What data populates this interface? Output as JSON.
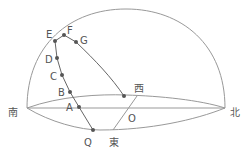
{
  "diagram": {
    "title": "",
    "colors": {
      "line": "#999999",
      "path": "#555555",
      "point": "#555555",
      "text": "#555555"
    },
    "directions": {
      "south": "南",
      "north": "北",
      "east": "東",
      "west": "西"
    },
    "center_label": "O",
    "points": [
      {
        "label": "A"
      },
      {
        "label": "B"
      },
      {
        "label": "C"
      },
      {
        "label": "D"
      },
      {
        "label": "E"
      },
      {
        "label": "F"
      },
      {
        "label": "G"
      },
      {
        "label": "Q"
      }
    ]
  }
}
